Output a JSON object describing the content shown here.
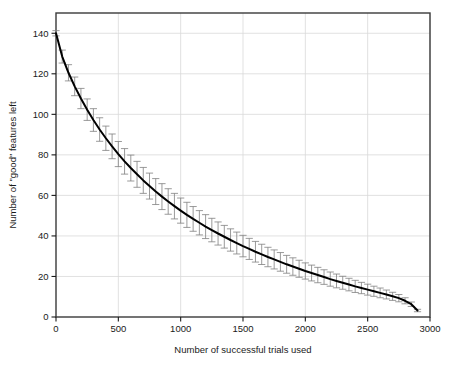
{
  "chart_data": {
    "type": "line",
    "title": "",
    "subtitle": "",
    "xlabel": "Number of successful trials used",
    "ylabel": "Number of \"good\" features left",
    "xlim": [
      0,
      3000
    ],
    "ylim": [
      0,
      150
    ],
    "xticks": [
      0,
      500,
      1000,
      1500,
      2000,
      2500,
      3000
    ],
    "yticks": [
      0,
      20,
      40,
      60,
      80,
      100,
      120,
      140
    ],
    "xticklabels": [
      "0",
      "500",
      "1000",
      "1500",
      "2000",
      "2500",
      "3000"
    ],
    "yticklabels": [
      "0",
      "20",
      "40",
      "60",
      "80",
      "100",
      "120",
      "140"
    ],
    "grid": true,
    "grid_color": "#d9d9d9",
    "legend": null,
    "legend_position": "none",
    "line_color": "#000000",
    "errorbar_color": "#808080",
    "frame_color": "#3a3a3a",
    "annotations": [],
    "series": [
      {
        "name": "mean good features remaining",
        "marker": "none",
        "linewidth": 2,
        "x": [
          0,
          50,
          100,
          150,
          200,
          250,
          300,
          350,
          400,
          450,
          500,
          550,
          600,
          650,
          700,
          750,
          800,
          850,
          900,
          950,
          1000,
          1050,
          1100,
          1150,
          1200,
          1250,
          1300,
          1350,
          1400,
          1450,
          1500,
          1550,
          1600,
          1650,
          1700,
          1750,
          1800,
          1850,
          1900,
          1950,
          2000,
          2050,
          2100,
          2150,
          2200,
          2250,
          2300,
          2350,
          2400,
          2450,
          2500,
          2550,
          2600,
          2650,
          2700,
          2750,
          2800,
          2850,
          2900
        ],
        "values": [
          140.0,
          128.5,
          120.5,
          113.8,
          107.8,
          102.3,
          97.2,
          92.5,
          88.2,
          84.2,
          80.4,
          76.8,
          73.5,
          70.4,
          67.4,
          64.6,
          61.9,
          59.4,
          57.0,
          54.7,
          52.5,
          50.4,
          48.4,
          46.5,
          44.6,
          42.9,
          41.2,
          39.6,
          38.0,
          36.5,
          35.0,
          33.6,
          32.2,
          30.9,
          29.6,
          28.4,
          27.2,
          26.0,
          24.9,
          23.8,
          22.7,
          21.7,
          20.7,
          19.7,
          18.7,
          17.8,
          16.9,
          16.0,
          15.1,
          14.3,
          13.5,
          12.7,
          11.9,
          11.1,
          10.2,
          9.3,
          8.0,
          6.3,
          3.2
        ],
        "errors": [
          1.3,
          3.2,
          4.0,
          4.6,
          5.0,
          5.3,
          5.6,
          5.8,
          6.0,
          6.1,
          6.2,
          6.3,
          6.4,
          6.4,
          6.4,
          6.4,
          6.4,
          6.4,
          6.3,
          6.3,
          6.2,
          6.2,
          6.1,
          6.0,
          5.9,
          5.8,
          5.7,
          5.6,
          5.5,
          5.4,
          5.3,
          5.2,
          5.1,
          5.0,
          4.8,
          4.7,
          4.6,
          4.4,
          4.3,
          4.2,
          4.0,
          3.9,
          3.8,
          3.6,
          3.5,
          3.4,
          3.2,
          3.1,
          3.0,
          2.8,
          2.7,
          2.5,
          2.4,
          2.2,
          2.0,
          1.8,
          1.5,
          1.1,
          0.6
        ]
      }
    ]
  }
}
